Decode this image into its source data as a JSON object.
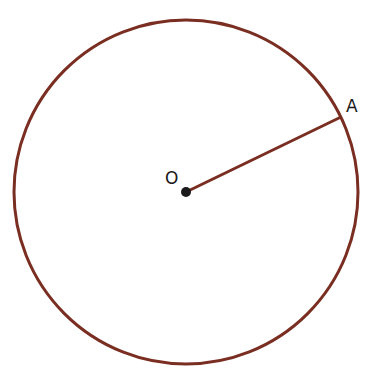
{
  "diagram": {
    "type": "circle-with-radius",
    "colors": {
      "circle": "#7a2e22",
      "radius": "#7a2e22",
      "point": "#1a1a1a",
      "label": "#1a1a1a"
    },
    "circle": {
      "cx": 186,
      "cy": 192,
      "r": 172
    },
    "center": {
      "label": "O",
      "x": 186,
      "y": 192
    },
    "point_on_circle": {
      "label": "A",
      "x": 341,
      "y": 117
    }
  }
}
